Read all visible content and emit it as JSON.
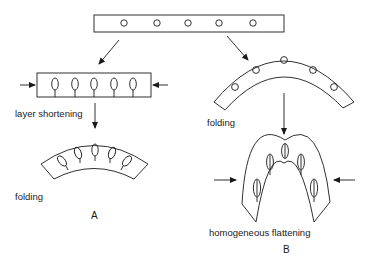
{
  "diagram": {
    "panel_a": {
      "label": "A",
      "step1_label": "layer shortening",
      "step2_label": "folding"
    },
    "panel_b": {
      "label": "B",
      "step1_label": "folding",
      "step2_label": "homogeneous flattening"
    },
    "initial_layer": {
      "marker_count": 5,
      "marker_shape": "circle"
    },
    "colors": {
      "stroke": "#1a1a1a",
      "background": "#ffffff"
    }
  }
}
